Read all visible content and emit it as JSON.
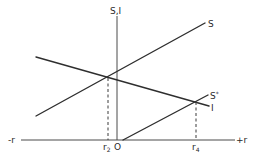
{
  "diagram": {
    "axes": {
      "y_label": "S,I",
      "x_neg_label": "-r",
      "x_pos_label": "+r",
      "origin_label": "O"
    },
    "curves": [
      {
        "name": "S",
        "label": "S",
        "from": [
          36,
          116
        ],
        "to": [
          205,
          23
        ]
      },
      {
        "name": "I",
        "label": "I",
        "from": [
          36,
          57
        ],
        "to": [
          209,
          106
        ]
      },
      {
        "name": "S*",
        "label": "S",
        "label_sup": "*",
        "from": [
          123,
          140
        ],
        "to": [
          208,
          95
        ]
      }
    ],
    "markers": [
      {
        "name": "r2",
        "label": "r",
        "sub": "2",
        "x": 108,
        "y_top": 78
      },
      {
        "name": "r4",
        "label": "r",
        "sub": "4",
        "x": 196,
        "y_top": 102
      }
    ]
  }
}
